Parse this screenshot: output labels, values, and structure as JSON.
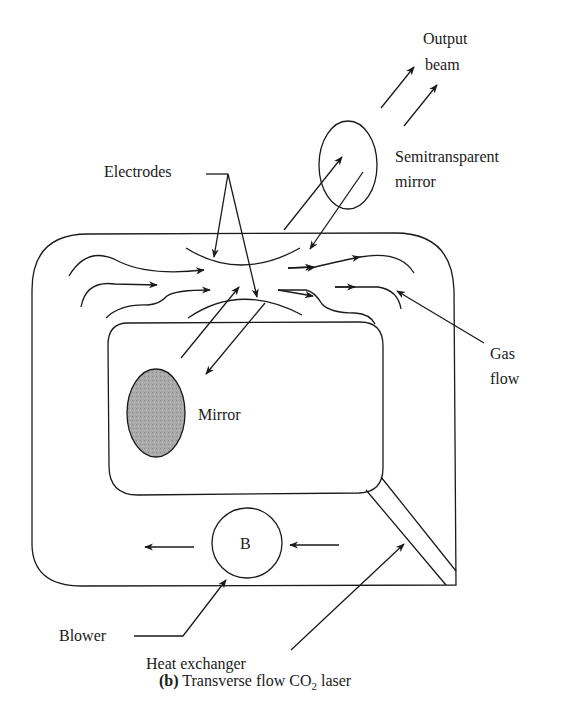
{
  "figure": {
    "type": "diagram",
    "stroke_color": "#1a1a1a",
    "mirror_fill": "#a8a8a8"
  },
  "labels": {
    "output_beam_line1": "Output",
    "output_beam_line2": "beam",
    "semitransparent_line1": "Semitransparent",
    "semitransparent_line2": "mirror",
    "electrodes": "Electrodes",
    "gas_flow_line1": "Gas",
    "gas_flow_line2": "flow",
    "mirror": "Mirror",
    "blower_symbol": "B",
    "blower": "Blower",
    "heat_exchanger": "Heat exchanger"
  },
  "caption": {
    "tag": "(b)",
    "text_before": " Transverse flow CO",
    "subscript": "2",
    "text_after": " laser"
  }
}
